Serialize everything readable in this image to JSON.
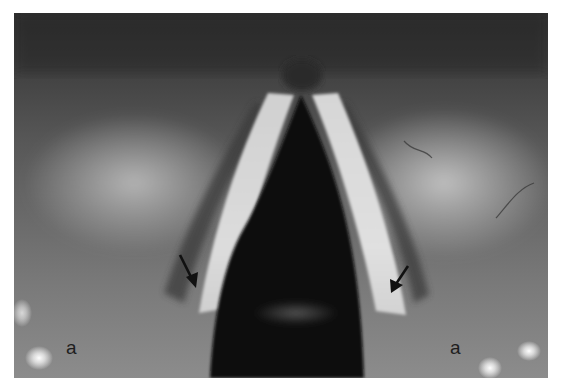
{
  "figure": {
    "labels": {
      "left": "a",
      "right": "a"
    },
    "arrows": [
      {
        "name": "left-arrow",
        "from": [
          180,
          255
        ],
        "to": [
          196,
          287
        ],
        "color": "#111111"
      },
      {
        "name": "right-arrow",
        "from": [
          408,
          266
        ],
        "to": [
          391,
          293
        ],
        "color": "#111111"
      }
    ],
    "colors": {
      "background": "#ffffff",
      "tissue_dark": "#2e2e2e",
      "tissue_mid": "#6e6e6e",
      "tissue_light": "#bdbdbd",
      "fold_highlight": "#d8d8d8",
      "airway": "#0b0b0b"
    }
  }
}
